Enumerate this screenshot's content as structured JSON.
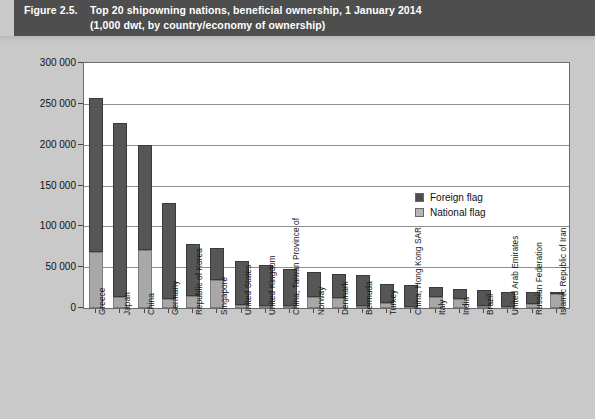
{
  "header": {
    "figure_number": "Figure 2.5.",
    "title_line1": "Top 20 shipowning nations, beneficial ownership, 1 January 2014",
    "title_line2": "(1,000 dwt, by country/economy of ownership)"
  },
  "chart_data": {
    "type": "bar",
    "stacked": true,
    "title": "Top 20 shipowning nations, beneficial ownership, 1 January 2014",
    "subtitle": "(1,000 dwt, by country/economy of ownership)",
    "xlabel": "",
    "ylabel": "",
    "ylim": [
      0,
      300000
    ],
    "yticks": [
      0,
      50000,
      100000,
      150000,
      200000,
      250000,
      300000
    ],
    "ytick_labels": [
      "0",
      "50 000",
      "100 000",
      "150 000",
      "200 000",
      "250 000",
      "300 000"
    ],
    "grid": true,
    "legend_position": "inside-right",
    "categories": [
      "Greece",
      "Japan",
      "China",
      "Germany",
      "Republic of Korea",
      "Singapore",
      "United States",
      "United Kingdom",
      "China, Taiwan Province of",
      "Norway",
      "Denmark",
      "Bermuda",
      "Turkey",
      "China, Hong Kong SAR",
      "Italy",
      "India",
      "Brazil",
      "United Arab Emirates",
      "Russian Federation",
      "Islamic Republic of Iran"
    ],
    "series": [
      {
        "name": "National flag",
        "color": "#a8a8a8",
        "values": [
          68000,
          14000,
          71000,
          11000,
          15000,
          34000,
          4000,
          3000,
          3000,
          14000,
          12000,
          2000,
          6000,
          1000,
          14000,
          11000,
          3000,
          1000,
          5000,
          17000
        ]
      },
      {
        "name": "Foreign flag",
        "color": "#565656",
        "values": [
          189000,
          213000,
          129000,
          117000,
          63000,
          40000,
          53000,
          50000,
          45000,
          30000,
          30000,
          39000,
          24000,
          27000,
          12000,
          12000,
          19000,
          19000,
          15000,
          3000
        ]
      }
    ],
    "totals": [
      257000,
      227000,
      200000,
      128000,
      78000,
      74000,
      57000,
      53000,
      48000,
      44000,
      42000,
      41000,
      30000,
      28000,
      26000,
      23000,
      22000,
      20000,
      20000,
      20000
    ],
    "legend": [
      {
        "label": "Foreign flag",
        "color": "#4d4d4d"
      },
      {
        "label": "National flag",
        "color": "#b5b5b5"
      }
    ]
  }
}
